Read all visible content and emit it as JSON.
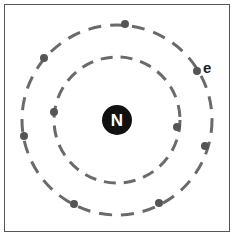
{
  "diagram": {
    "nucleus": {
      "label": "N",
      "cx": 117,
      "cy": 120,
      "r": 15,
      "fill": "#111111",
      "text_color": "#ffffff"
    },
    "shells": [
      {
        "name": "inner",
        "cx": 117,
        "cy": 120,
        "r": 63,
        "electrons": 2
      },
      {
        "name": "outer",
        "cx": 117,
        "cy": 120,
        "r": 95,
        "electrons": 8
      }
    ],
    "electrons": [
      {
        "shell": "inner",
        "cx": 54,
        "cy": 112
      },
      {
        "shell": "inner",
        "cx": 177,
        "cy": 127
      },
      {
        "shell": "outer",
        "cx": 125,
        "cy": 24
      },
      {
        "shell": "outer",
        "cx": 197,
        "cy": 71
      },
      {
        "shell": "outer",
        "cx": 205,
        "cy": 146
      },
      {
        "shell": "outer",
        "cx": 159,
        "cy": 203
      },
      {
        "shell": "outer",
        "cx": 74,
        "cy": 204
      },
      {
        "shell": "outer",
        "cx": 24,
        "cy": 136
      },
      {
        "shell": "outer",
        "cx": 44,
        "cy": 58
      }
    ],
    "electron_label": {
      "text": "e",
      "x": 203,
      "y": 73
    },
    "colors": {
      "shell_stroke": "#6a6a6a",
      "electron": "#555555",
      "border": "#555555"
    }
  }
}
